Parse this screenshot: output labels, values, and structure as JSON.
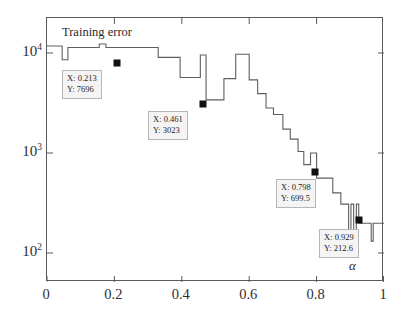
{
  "chart_data": {
    "type": "line",
    "title": "Training error",
    "xlabel": "α",
    "ylabel": "",
    "xlim": [
      0,
      1
    ],
    "ylim": [
      100,
      14000
    ],
    "yscale": "log",
    "xscale": "linear",
    "grid": false,
    "legend": "none",
    "line_style": "stairs",
    "line_color": "#555555",
    "marker_color": "#111111",
    "xticks": [
      "0",
      "0.2",
      "0.4",
      "0.6",
      "0.8",
      "1"
    ],
    "xtick_values": [
      0,
      0.2,
      0.4,
      0.6,
      0.8,
      1
    ],
    "yticks": [
      "10^2",
      "10^3",
      "10^4"
    ],
    "ytick_values": [
      100,
      1000,
      10000
    ],
    "series": [
      {
        "name": "Training error",
        "x": [
          0.0,
          0.03,
          0.03,
          0.045,
          0.045,
          0.062,
          0.062,
          0.155,
          0.155,
          0.175,
          0.175,
          0.3,
          0.3,
          0.33,
          0.33,
          0.395,
          0.395,
          0.42,
          0.42,
          0.455,
          0.455,
          0.472,
          0.472,
          0.505,
          0.505,
          0.525,
          0.525,
          0.56,
          0.56,
          0.578,
          0.578,
          0.6,
          0.6,
          0.625,
          0.625,
          0.65,
          0.65,
          0.672,
          0.672,
          0.7,
          0.7,
          0.722,
          0.722,
          0.745,
          0.745,
          0.762,
          0.762,
          0.782,
          0.782,
          0.79,
          0.79,
          0.8,
          0.8,
          0.822,
          0.822,
          0.848,
          0.848,
          0.872,
          0.872,
          0.895,
          0.895,
          0.902,
          0.902,
          0.91,
          0.91,
          0.918,
          0.918,
          0.925,
          0.925,
          0.935,
          0.935,
          0.962,
          0.962,
          0.968,
          0.968,
          1.0
        ],
        "y": [
          8300,
          8300,
          8300,
          8300,
          6400,
          6400,
          8050,
          8050,
          8600,
          8600,
          8050,
          8050,
          8050,
          8050,
          6700,
          6700,
          4600,
          4600,
          4600,
          4600,
          7000,
          7000,
          3023,
          3023,
          3023,
          3023,
          4500,
          4500,
          7100,
          7100,
          7100,
          7100,
          4400,
          4400,
          3400,
          3400,
          2600,
          2600,
          2300,
          2300,
          1750,
          1750,
          1450,
          1450,
          1150,
          1150,
          900,
          900,
          1120,
          1120,
          1120,
          1120,
          699.5,
          699.5,
          699.5,
          699.5,
          530,
          530,
          430,
          430,
          215,
          215,
          430,
          430,
          212.6,
          212.6,
          430,
          430,
          300,
          300,
          300,
          300,
          215,
          215,
          300,
          300
        ],
        "n_points": 76
      }
    ],
    "datatips": [
      {
        "id": "datatip-1",
        "x_label": "X: 0.213",
        "y_label": "Y: 7696",
        "x": 0.213,
        "y": 7696
      },
      {
        "id": "datatip-2",
        "x_label": "X: 0.461",
        "y_label": "Y: 3023",
        "x": 0.461,
        "y": 3023
      },
      {
        "id": "datatip-3",
        "x_label": "X: 0.798",
        "y_label": "Y: 699.5",
        "x": 0.798,
        "y": 699.5
      },
      {
        "id": "datatip-4",
        "x_label": "X: 0.929",
        "y_label": "Y: 212.6",
        "x": 0.929,
        "y": 212.6
      }
    ]
  },
  "axes": {
    "y_ticks": [
      {
        "mantissa": "10",
        "exponent": "4",
        "value": 10000
      },
      {
        "mantissa": "10",
        "exponent": "3",
        "value": 1000
      },
      {
        "mantissa": "10",
        "exponent": "2",
        "value": 100
      }
    ],
    "x_ticks": [
      {
        "label": "0",
        "value": 0
      },
      {
        "label": "0.2",
        "value": 0.2
      },
      {
        "label": "0.4",
        "value": 0.4
      },
      {
        "label": "0.6",
        "value": 0.6
      },
      {
        "label": "0.8",
        "value": 0.8
      },
      {
        "label": "1",
        "value": 1
      }
    ],
    "x_axis_label": "α"
  },
  "annotations": {
    "title_text": "Training error"
  }
}
